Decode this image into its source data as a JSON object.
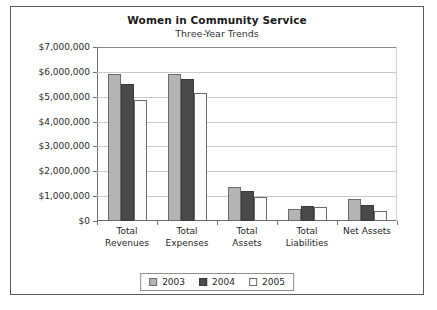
{
  "chart_data": {
    "type": "bar",
    "title": "Women in Community Service",
    "subtitle": "Three-Year Trends",
    "xlabel": "",
    "ylabel": "",
    "ylim": [
      0,
      7000000
    ],
    "ytick_step": 1000000,
    "grid": true,
    "legend_position": "bottom",
    "categories": [
      "Total Revenues",
      "Total Expenses",
      "Total Assets",
      "Total Liabilities",
      "Net Assets"
    ],
    "category_lines": [
      [
        "Total",
        "Revenues"
      ],
      [
        "Total",
        "Expenses"
      ],
      [
        "Total",
        "Assets"
      ],
      [
        "Total",
        "Liabilities"
      ],
      [
        "Net Assets"
      ]
    ],
    "ytick_labels": [
      "$7,000,000",
      "$6,000,000",
      "$5,000,000",
      "$4,000,000",
      "$3,000,000",
      "$2,000,000",
      "$1,000,000",
      "$0"
    ],
    "ytick_values": [
      7000000,
      6000000,
      5000000,
      4000000,
      3000000,
      2000000,
      1000000,
      0
    ],
    "series": [
      {
        "name": "2003",
        "color": "#b4b4b4",
        "values": [
          5900000,
          5900000,
          1350000,
          500000,
          900000
        ]
      },
      {
        "name": "2004",
        "color": "#4a4a4a",
        "values": [
          5500000,
          5700000,
          1200000,
          600000,
          650000
        ]
      },
      {
        "name": "2005",
        "color": "#fbfbfb",
        "values": [
          4850000,
          5150000,
          980000,
          580000,
          400000
        ]
      }
    ]
  },
  "legend": {
    "items": [
      {
        "label": "2003",
        "swatch": "legend-swatch-2003"
      },
      {
        "label": "2004",
        "swatch": "legend-swatch-2004"
      },
      {
        "label": "2005",
        "swatch": "legend-swatch-2005"
      }
    ]
  },
  "colors": {
    "series_2003": "#b4b4b4",
    "series_2004": "#4a4a4a",
    "series_2005": "#fbfbfb",
    "frame_border": "#5a5a5a",
    "axis": "#6f6f6f",
    "gridline": "#c9c9c9",
    "text": "#1f1f1f",
    "background": "#ffffff"
  }
}
